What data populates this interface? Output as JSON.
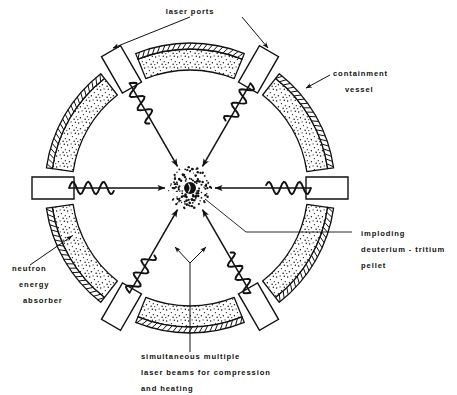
{
  "figure": {
    "background_color": "#ffffff",
    "ink_color": "#111111"
  },
  "labels": {
    "laser_ports": "laser  ports",
    "containment_line1": "containment",
    "containment_line2": "vessel",
    "pellet_line1": "imploding",
    "pellet_line2": "deuterium - tritium",
    "pellet_line3": "pellet",
    "absorber_line1": "neutron",
    "absorber_line2": "energy",
    "absorber_line3": "absorber",
    "beams_line1": "simultaneous  multiple",
    "beams_line2": "laser  beams  for  compression",
    "beams_line3": "and  heating"
  },
  "geometry": {
    "center_x": 190,
    "center_y": 188,
    "outer_radius": 145,
    "inner_radius": 118,
    "segment_count": 6,
    "port_count": 6,
    "segment_angles_deg": [
      30,
      90,
      150,
      210,
      270,
      330
    ],
    "port_angles_deg": [
      0,
      60,
      120,
      180,
      240,
      300
    ],
    "pellet_radius": 6,
    "pellet_halo_radius": 21
  },
  "parts": {
    "containment_band": "cross-hatched outer shell",
    "neutron_absorber": "stippled inner annulus",
    "laser_port": "rectangular radial channel",
    "pellet": "black filled sphere",
    "laser_beam": "wavy arrow converging on pellet"
  }
}
